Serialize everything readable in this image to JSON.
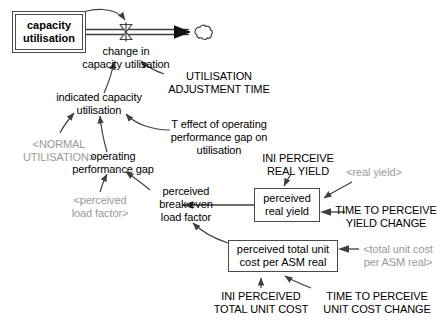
{
  "diagram": {
    "colors": {
      "line": "#3f3f3f",
      "text": "#000000",
      "shadow_text": "#9a9a9a",
      "box_border": "#4a4a4a",
      "background": "#ffffff"
    },
    "stock": {
      "name": "capacity utilisation",
      "label": "capacity\nutilisation"
    },
    "flow": {
      "name": "change in capacity utilisation",
      "label": "change in\ncapacity utilisation"
    },
    "boxed_variables": [
      {
        "name": "perceived real yield",
        "label": "perceived\nreal yield"
      },
      {
        "name": "perceived total unit cost per ASM real",
        "label": "perceived total unit\ncost per ASM real"
      }
    ],
    "variables": [
      {
        "name": "indicated capacity utilisation",
        "label": "indicated capacity\nutilisation"
      },
      {
        "name": "operating performance gap",
        "label": "operating\nperformance gap"
      },
      {
        "name": "perceived break even load factor",
        "label": "perceived\nbreak even\nload factor"
      },
      {
        "name": "T effect of operating performance gap on utilisation",
        "label": "T effect of operating\nperformance gap on\nutilisation"
      }
    ],
    "constants": [
      {
        "name": "UTILISATION ADJUSTMENT TIME",
        "label": "UTILISATION\nADJUSTMENT TIME"
      },
      {
        "name": "INI PERCEIVE REAL YIELD",
        "label": "INI PERCEIVE\nREAL YIELD"
      },
      {
        "name": "TIME TO PERCEIVE YIELD CHANGE",
        "label": "TIME TO PERCEIVE\nYIELD CHANGE"
      },
      {
        "name": "INI PERCEIVED TOTAL UNIT COST",
        "label": "INI PERCEIVED\nTOTAL UNIT COST"
      },
      {
        "name": "TIME TO PERCEIVE UNIT COST CHANGE",
        "label": "TIME TO PERCEIVE\nUNIT COST CHANGE"
      }
    ],
    "shadow_variables": [
      {
        "name": "NORMAL UTILISATION",
        "label": "<NORMAL\nUTILISATION>"
      },
      {
        "name": "perceived load factor",
        "label": "<perceived\nload factor>"
      },
      {
        "name": "real yield",
        "label": "<real yield>"
      },
      {
        "name": "total unit cost per ASM real",
        "label": "<total unit cost\nper ASM real>"
      }
    ],
    "labels": {
      "stock_line1": "capacity",
      "stock_line2": "utilisation",
      "flow_line1": "change in",
      "flow_line2": "capacity utilisation",
      "uat_line1": "UTILISATION",
      "uat_line2": "ADJUSTMENT TIME",
      "icu_line1": "indicated capacity",
      "icu_line2": "utilisation",
      "normal_util_line1": "<NORMAL",
      "normal_util_line2": "UTILISATION>",
      "teffect_line1": "T effect of operating",
      "teffect_line2": "performance gap on",
      "teffect_line3": "utilisation",
      "opgap_line1": "operating",
      "opgap_line2": "performance gap",
      "plf_line1": "<perceived",
      "plf_line2": "load factor>",
      "pbelf_line1": "perceived",
      "pbelf_line2": "break even",
      "pbelf_line3": "load factor",
      "pry_line1": "perceived",
      "pry_line2": "real yield",
      "ini_pry_line1": "INI PERCEIVE",
      "ini_pry_line2": "REAL YIELD",
      "real_yield_shadow": "<real yield>",
      "ttpyc_line1": "TIME TO PERCEIVE",
      "ttpyc_line2": "YIELD CHANGE",
      "ptuc_line1": "perceived total unit",
      "ptuc_line2": "cost per ASM real",
      "tuc_shadow_line1": "<total unit cost",
      "tuc_shadow_line2": "per ASM real>",
      "ini_ptuc_line1": "INI PERCEIVED",
      "ini_ptuc_line2": "TOTAL UNIT COST",
      "ttpucc_line1": "TIME TO PERCEIVE",
      "ttpucc_line2": "UNIT COST CHANGE"
    }
  }
}
